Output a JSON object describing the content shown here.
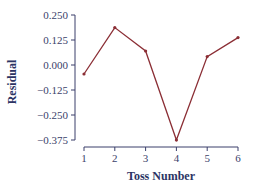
{
  "chart_data": {
    "type": "line",
    "title": "",
    "xlabel": "Toss Number",
    "ylabel": "Residual",
    "x": [
      1,
      2,
      3,
      4,
      5,
      6
    ],
    "categories": [
      "1",
      "2",
      "3",
      "4",
      "5",
      "6"
    ],
    "series": [
      {
        "name": "Residual",
        "values": [
          -0.045,
          0.187,
          0.07,
          -0.375,
          0.042,
          0.137
        ]
      }
    ],
    "y_ticks": [
      "0.250",
      "0.125",
      "0.000",
      "−0.125",
      "−0.250",
      "−0.375"
    ],
    "y_tick_values": [
      0.25,
      0.125,
      0.0,
      -0.125,
      -0.25,
      -0.375
    ],
    "x_ticks": [
      "1",
      "2",
      "3",
      "4",
      "5",
      "6"
    ],
    "ylim": [
      -0.375,
      0.25
    ],
    "xlim": [
      1,
      6
    ],
    "grid": false,
    "legend": "none"
  },
  "colors": {
    "line": "#8b2e35",
    "axis": "#3a3f6a",
    "text": "#2c3464"
  }
}
